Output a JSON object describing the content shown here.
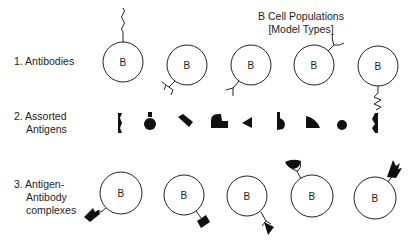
{
  "title": {
    "line1": "B Cell Populations",
    "line2": "[Model Types]"
  },
  "rows": [
    {
      "label_line1": "1. Antibodies",
      "label_line2": "",
      "label_line3": ""
    },
    {
      "label_line1": "2. Assorted",
      "label_line2": "Antigens",
      "label_line3": ""
    },
    {
      "label_line1": "3. Antigen-",
      "label_line2": "Antibody",
      "label_line3": "complexes"
    }
  ],
  "cell_letter": "B",
  "antibody_cells": [
    {
      "receptor": "wavy",
      "position": "top"
    },
    {
      "receptor": "forked-bracket",
      "position": "bottom-left"
    },
    {
      "receptor": "y-shape",
      "position": "bottom-left"
    },
    {
      "receptor": "cup",
      "position": "top-right"
    },
    {
      "receptor": "zigzag",
      "position": "bottom"
    }
  ],
  "antigens": [
    "notched-wedge",
    "round-flask",
    "tilted-rectangle",
    "stepped-block",
    "triangle",
    "hook",
    "quarter-disc",
    "circle",
    "double-notched-wedge"
  ],
  "complex_cells": [
    {
      "bound": "wavy+notched-wedge",
      "position": "bottom-left"
    },
    {
      "bound": "bracket+tilted-rectangle",
      "position": "bottom-right"
    },
    {
      "bound": "y-shape+triangle",
      "position": "bottom-right"
    },
    {
      "bound": "cup+quarter-disc",
      "position": "top-left"
    },
    {
      "bound": "zigzag+double-notched-wedge",
      "position": "top-right"
    }
  ],
  "colors": {
    "stroke": "#222222",
    "fill": "#111111",
    "background": "#ffffff"
  }
}
